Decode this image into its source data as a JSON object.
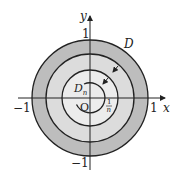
{
  "diagram": {
    "type": "concentric-regions",
    "axes": {
      "x_label": "x",
      "y_label": "y",
      "origin_label": "O",
      "tick_labels": {
        "x_pos": "1",
        "x_neg": "−1",
        "y_pos": "1",
        "y_neg": "−1"
      }
    },
    "regions": [
      {
        "name": "D",
        "label": "D",
        "description": "unit disk",
        "fill": "#bdbdbd"
      },
      {
        "name": "D_n",
        "label_main": "D",
        "label_sub": "n",
        "fill": "#ececec"
      }
    ],
    "inner_radius_label": {
      "numerator": "1",
      "denominator": "n"
    },
    "arrows": [
      {
        "direction": "inward",
        "between": "outer rings"
      },
      {
        "direction": "inward",
        "between": "inner rings"
      }
    ],
    "colors": {
      "outer_ring": "#bdbdbd",
      "middle_ring": "#dcdcdc",
      "inner_disk": "#ececec",
      "stroke": "#222222"
    }
  }
}
